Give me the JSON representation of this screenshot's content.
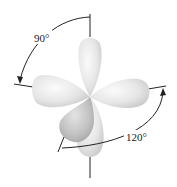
{
  "diagram": {
    "title": "",
    "labels": {
      "angle_top": "90°",
      "angle_bottom": "120°"
    },
    "colors": {
      "lobe_light": "#f2f2f2",
      "lobe_mid": "#d6d6d6",
      "lobe_dark": "#a8a8a8",
      "line": "#222222",
      "background": "#ffffff"
    },
    "lobes": [
      {
        "name": "top",
        "direction": "up"
      },
      {
        "name": "left",
        "direction": "left"
      },
      {
        "name": "right",
        "direction": "right"
      },
      {
        "name": "front-lower-left",
        "direction": "down-left"
      },
      {
        "name": "back-lower",
        "direction": "down"
      }
    ]
  }
}
